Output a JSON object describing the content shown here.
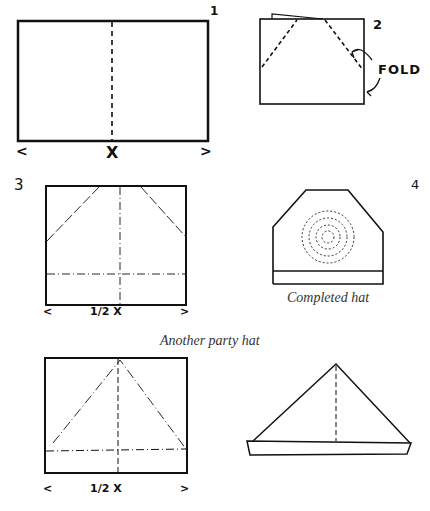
{
  "diagrams": [
    {
      "step": "1",
      "marks": {
        "left": "<",
        "center": "X",
        "right": ">"
      }
    },
    {
      "step": "2",
      "annotation": "FOLD"
    },
    {
      "step": "3",
      "marks": {
        "left": "<",
        "center": "1/2 X",
        "right": ">"
      }
    },
    {
      "step": "4",
      "caption": "Completed hat"
    }
  ],
  "section_title": "Another party hat",
  "second": {
    "marks": {
      "left": "<",
      "center": "1/2 X",
      "right": ">"
    }
  }
}
